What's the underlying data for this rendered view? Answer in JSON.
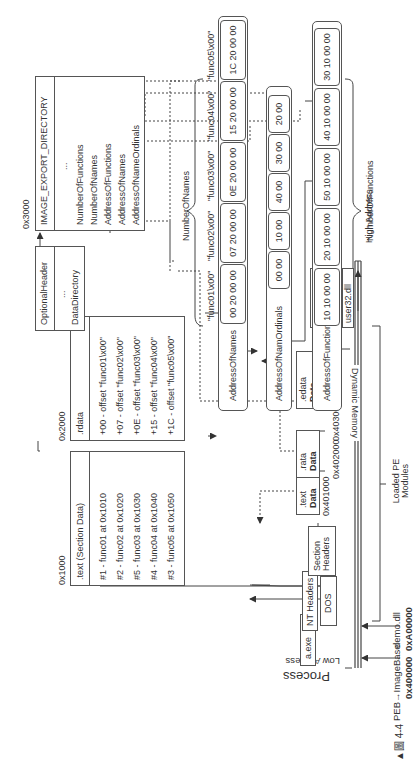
{
  "figure": {
    "caption": "▲圖 4-4",
    "process_label": "Process",
    "low_address": "Low Address",
    "high_address": "High Address",
    "dynamic_memory": "Dynamic Memory",
    "loaded_pe_modules": "Loaded PE Modules",
    "peb_label": "PEB→ImageBase",
    "peb_addr": "0x400000",
    "demo_label": "demo.dll",
    "demo_addr": "0xA00000",
    "aexe": "a.exe",
    "headers": [
      "DOS",
      "NT Headers",
      "Section Headers"
    ],
    "sections": [
      {
        "addr": "0x401000",
        "name": ".text",
        "sub": "Data"
      },
      {
        "addr": "0x402000",
        "name": ".rata",
        "sub": "Data"
      },
      {
        "addr": "0x403000",
        "name": ".edata",
        "sub": "Data"
      }
    ],
    "system_dlls": [
      "ntdll.dll",
      "kernel32.dll",
      "user32.dll"
    ],
    "text_section": {
      "offset": "0x1000",
      "title": ".text (Section Data)",
      "rows": [
        "#1 - func01 at 0x1010",
        "#2 - func02 at 0x1020",
        "#5 - func03 at 0x1030",
        "#4 - func04 at 0x1040",
        "#3 - func05 at 0x1050"
      ]
    },
    "rdata_section": {
      "offset": "0x2000",
      "title": ".rdata",
      "rows": [
        "+00 - offset \"func01\\x00\"",
        "+07 - offset \"func02\\x00\"",
        "+0E - offset \"func03\\x00\"",
        "+15 - offset \"func04\\x00\"",
        "+1C - offset \"func05\\x00\""
      ]
    },
    "optional_header": {
      "title": "OptionalHeader",
      "ellipsis": "...",
      "field": "DataDirectory"
    },
    "export_dir": {
      "offset": "0x3000",
      "title": "IMAGE_EXPORT_DIRECTORY",
      "ellipsis": "...",
      "fields": [
        "NumberOfFunctions",
        "NumberOfNames",
        "AddressOfFunctions",
        "AddressOfNames",
        "AddressOfNameOrdinals"
      ]
    },
    "names_array": {
      "label": "AddressOfNames",
      "brace_label": "NumberOfNames",
      "cells": [
        "00 20 00 00",
        "07 20 00 00",
        "0E 20 00 00",
        "15 20 00 00",
        "1C 20 00 00"
      ],
      "strings": [
        "\"func01\\x00\"",
        "\"func02\\x00\"",
        "\"func03\\x00\"",
        "\"func04\\x00\"",
        "\"func05\\x00\""
      ]
    },
    "ordinals_array": {
      "label": "AddressOfNamOrdinals",
      "cells": [
        "00 00",
        "10 00",
        "40 00",
        "30 00",
        "20 00"
      ]
    },
    "functions_array": {
      "label": "AddressOfFunctions",
      "brace_label": "NumberOfFunctions",
      "cells": [
        "10 10 00 00",
        "20 10 00 00",
        "50 10 00 00",
        "40 10 00 00",
        "30 10 00 00"
      ]
    }
  }
}
